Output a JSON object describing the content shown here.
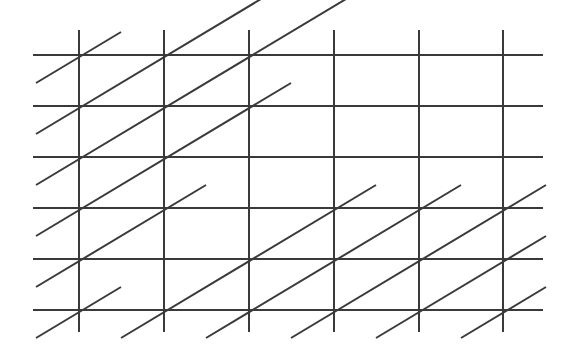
{
  "figure": {
    "kind": "geometric-lattice-diagram",
    "canvas": {
      "width": 575,
      "height": 351,
      "background_color": "#ffffff"
    },
    "style": {
      "line_color": "#3a3a3a",
      "line_width": 2.0,
      "diagonal_line_width": 2.0
    },
    "grid": {
      "vertical_line_count": 6,
      "horizontal_line_count": 6,
      "vertical_line_x": [
        79,
        164,
        249,
        334,
        419,
        503
      ],
      "horizontal_line_y": [
        55,
        106,
        157,
        208,
        259,
        310
      ],
      "column_spacing": 85,
      "row_spacing": 51,
      "horizontal_extent_x": [
        33,
        543
      ],
      "vertical_extent_y": [
        30,
        332
      ]
    },
    "diagonals": {
      "description": "Parallel lines of positive visual slope, each passing through lattice points one cell right and one cell up",
      "direction": "up-to-the-right",
      "dx_per_step": 85,
      "dy_per_step": -51,
      "count": 11,
      "overshoot_cells": 0.5
    }
  },
  "chart_data": {
    "type": "line",
    "xlabel": "",
    "ylabel": "",
    "xlim": [
      33,
      543
    ],
    "ylim": [
      30,
      332
    ],
    "grid": true,
    "legend": null,
    "series": [
      {
        "name": "horizontal-lines",
        "stroke": "#3a3a3a",
        "lines": [
          {
            "x1": 33,
            "y1": 55,
            "x2": 543,
            "y2": 55
          },
          {
            "x1": 33,
            "y1": 106,
            "x2": 543,
            "y2": 106
          },
          {
            "x1": 33,
            "y1": 157,
            "x2": 543,
            "y2": 157
          },
          {
            "x1": 33,
            "y1": 208,
            "x2": 543,
            "y2": 208
          },
          {
            "x1": 33,
            "y1": 259,
            "x2": 543,
            "y2": 259
          },
          {
            "x1": 33,
            "y1": 310,
            "x2": 543,
            "y2": 310
          }
        ]
      },
      {
        "name": "vertical-lines",
        "stroke": "#3a3a3a",
        "lines": [
          {
            "x1": 79,
            "y1": 30,
            "x2": 79,
            "y2": 332
          },
          {
            "x1": 164,
            "y1": 30,
            "x2": 164,
            "y2": 332
          },
          {
            "x1": 249,
            "y1": 30,
            "x2": 249,
            "y2": 332
          },
          {
            "x1": 334,
            "y1": 30,
            "x2": 334,
            "y2": 332
          },
          {
            "x1": 419,
            "y1": 30,
            "x2": 419,
            "y2": 332
          },
          {
            "x1": 503,
            "y1": 30,
            "x2": 503,
            "y2": 332
          }
        ]
      },
      {
        "name": "diagonal-lines",
        "stroke": "#3a3a3a",
        "lines": [
          {
            "x1": 36,
            "y1": 338,
            "x2": 121,
            "y2": 287
          },
          {
            "x1": 36,
            "y1": 287,
            "x2": 206,
            "y2": 185
          },
          {
            "x1": 36,
            "y1": 236,
            "x2": 291,
            "y2": 83
          },
          {
            "x1": 36,
            "y1": 185,
            "x2": 376,
            "y2": -19
          },
          {
            "x1": 36,
            "y1": 134,
            "x2": 291,
            "y2": -19
          },
          {
            "x1": 36,
            "y1": 83,
            "x2": 121,
            "y2": 32
          },
          {
            "x1": 121,
            "y1": 338,
            "x2": 376,
            "y2": 185
          },
          {
            "x1": 206,
            "y1": 338,
            "x2": 461,
            "y2": 185
          },
          {
            "x1": 291,
            "y1": 338,
            "x2": 546,
            "y2": 185
          },
          {
            "x1": 376,
            "y1": 338,
            "x2": 546,
            "y2": 236
          },
          {
            "x1": 461,
            "y1": 338,
            "x2": 546,
            "y2": 287
          }
        ]
      }
    ]
  }
}
